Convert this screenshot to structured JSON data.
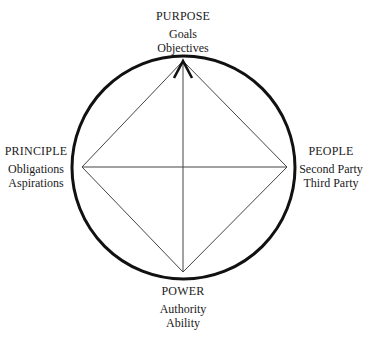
{
  "diagram": {
    "type": "circle-with-inscribed-diamond",
    "nodes": {
      "top": {
        "title": "PURPOSE",
        "items": [
          "Goals",
          "Objectives"
        ]
      },
      "left": {
        "title": "PRINCIPLE",
        "items": [
          "Obligations",
          "Aspirations"
        ]
      },
      "right": {
        "title": "PEOPLE",
        "items": [
          "Second Party",
          "Third Party"
        ]
      },
      "bottom": {
        "title": "POWER",
        "items": [
          "Authority",
          "Ability"
        ]
      }
    },
    "edges": [
      [
        "left",
        "top"
      ],
      [
        "top",
        "right"
      ],
      [
        "right",
        "bottom"
      ],
      [
        "bottom",
        "left"
      ],
      [
        "left",
        "right"
      ],
      [
        "top",
        "bottom"
      ]
    ],
    "arrowhead": "top",
    "colors": {
      "circle": "#111111",
      "lines": "#444444",
      "arrow": "#111111",
      "text": "#1a1a1a"
    }
  }
}
